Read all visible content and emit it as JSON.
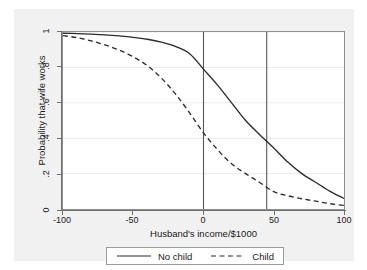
{
  "chart_data": {
    "type": "line",
    "title": "",
    "xlabel": "Husband's income/$1000",
    "ylabel": "Probability that wife works",
    "xlim": [
      -100,
      100
    ],
    "ylim": [
      0,
      1
    ],
    "xticks": [
      "-100",
      "-50",
      "0",
      "50",
      "100"
    ],
    "xtick_values": [
      -100,
      -50,
      0,
      50,
      100
    ],
    "yticks": [
      "0",
      ".2",
      ".4",
      ".6",
      ".8",
      "1"
    ],
    "ytick_values": [
      0,
      0.2,
      0.4,
      0.6,
      0.8,
      1
    ],
    "grid": "horizontal",
    "legend_position": "bottom-outside",
    "x": [
      -100,
      -90,
      -80,
      -70,
      -60,
      -50,
      -40,
      -30,
      -20,
      -10,
      0,
      10,
      20,
      30,
      40,
      50,
      60,
      70,
      80,
      90,
      100
    ],
    "series": [
      {
        "name": "No child",
        "style": "solid",
        "color": "#2b2b2b",
        "values": [
          0.993,
          0.991,
          0.988,
          0.984,
          0.978,
          0.97,
          0.959,
          0.943,
          0.919,
          0.879,
          0.79,
          0.7,
          0.6,
          0.5,
          0.42,
          0.345,
          0.265,
          0.2,
          0.15,
          0.1,
          0.06
        ]
      },
      {
        "name": "Child",
        "style": "dashed",
        "color": "#2b2b2b",
        "values": [
          0.98,
          0.968,
          0.95,
          0.927,
          0.898,
          0.86,
          0.81,
          0.74,
          0.65,
          0.545,
          0.43,
          0.335,
          0.255,
          0.2,
          0.15,
          0.098,
          0.075,
          0.058,
          0.044,
          0.03,
          0.02
        ]
      }
    ],
    "reference_lines": [
      {
        "name": "vline-zero",
        "x": 0,
        "orientation": "vertical"
      },
      {
        "name": "vline-mean",
        "x": 45,
        "orientation": "vertical"
      }
    ],
    "colors": {
      "graph_region": "#f1f1f1",
      "plot_background": "#ffffff",
      "axis": "#6f6f6f",
      "gridline": "#eaeaea",
      "line": "#2b2b2b",
      "reference_line": "#555555"
    }
  },
  "legend": {
    "entries": [
      {
        "label": "No child",
        "style": "solid"
      },
      {
        "label": "Child",
        "style": "dashed"
      }
    ]
  }
}
